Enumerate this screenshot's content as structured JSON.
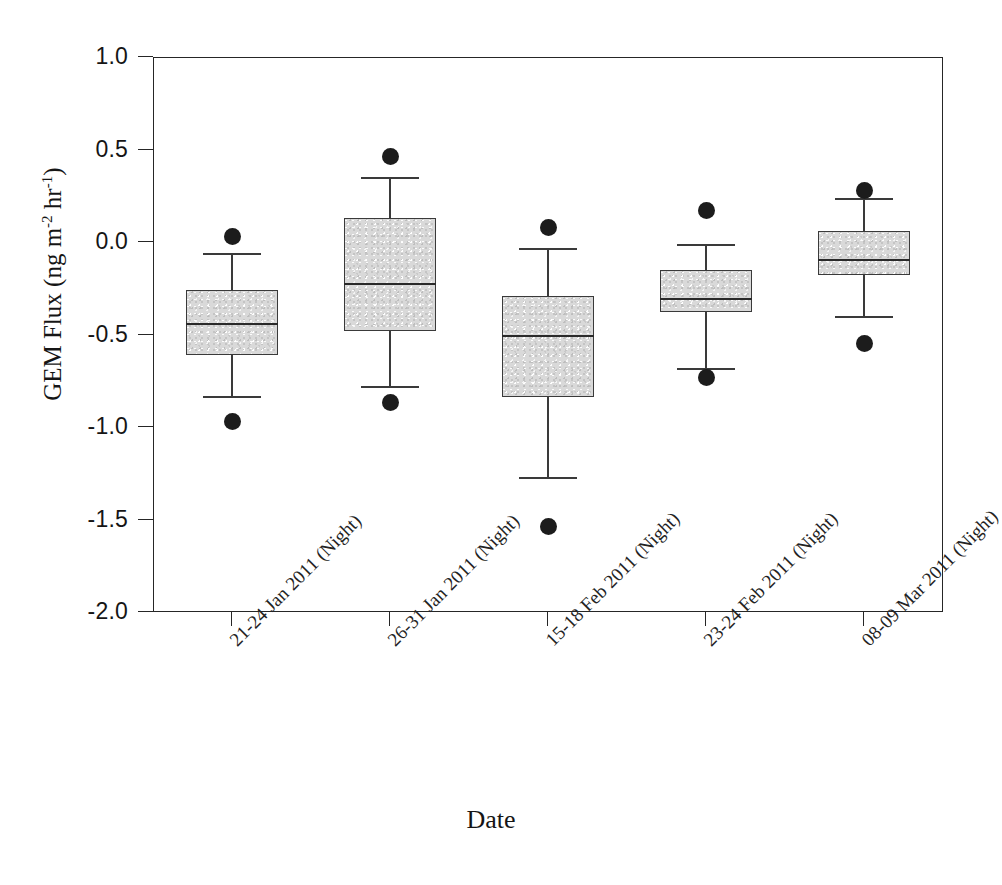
{
  "chart_data": {
    "type": "box",
    "title": "",
    "xlabel": "Date",
    "ylabel": "GEM Flux (ng m-2 hr-1)",
    "ylabel_parts": {
      "prefix": "GEM Flux (ng m",
      "exp1": "-2",
      "mid": " hr",
      "exp2": "-1",
      "suffix": ")"
    },
    "ylim": [
      -2.0,
      1.0
    ],
    "ytick_labels": [
      "1.0",
      "0.5",
      "0.0",
      "-0.5",
      "-1.0",
      "-1.5",
      "-2.0"
    ],
    "ytick_values": [
      1.0,
      0.5,
      0.0,
      -0.5,
      -1.0,
      -1.5,
      -2.0
    ],
    "grid": false,
    "legend": "none",
    "categories": [
      "21-24 Jan 2011 (Night)",
      "26-31 Jan 2011 (Night)",
      "15-18 Feb 2011 (Night)",
      "23-24 Feb 2011 (Night)",
      "08-09 Mar 2011 (Night)"
    ],
    "boxes": [
      {
        "category": "21-24 Jan 2011 (Night)",
        "whisker_high": -0.06,
        "q3": -0.26,
        "median": -0.44,
        "q1": -0.61,
        "whisker_low": -0.83,
        "outliers": [
          0.03,
          -0.97
        ]
      },
      {
        "category": "26-31 Jan 2011 (Night)",
        "whisker_high": 0.35,
        "q3": 0.13,
        "median": -0.22,
        "q1": -0.48,
        "whisker_low": -0.78,
        "outliers": [
          0.46,
          -0.87
        ]
      },
      {
        "category": "15-18 Feb 2011 (Night)",
        "whisker_high": -0.03,
        "q3": -0.29,
        "median": -0.5,
        "q1": -0.84,
        "whisker_low": -1.27,
        "outliers": [
          0.08,
          -1.54
        ]
      },
      {
        "category": "23-24 Feb 2011 (Night)",
        "whisker_high": -0.01,
        "q3": -0.15,
        "median": -0.3,
        "q1": -0.38,
        "whisker_low": -0.68,
        "outliers": [
          0.17,
          -0.73
        ]
      },
      {
        "category": "08-09 Mar 2011 (Night)",
        "whisker_high": 0.24,
        "q3": 0.06,
        "median": -0.09,
        "q1": -0.18,
        "whisker_low": -0.4,
        "outliers": [
          0.28,
          -0.55
        ]
      }
    ],
    "colors": {
      "box_fill": "#d9d9d9",
      "box_edge": "#3a3a3a",
      "median": "#2a2a2a",
      "whisker": "#3a3a3a",
      "outlier": "#1c1c1c",
      "axis": "#262626"
    }
  },
  "caption": ""
}
